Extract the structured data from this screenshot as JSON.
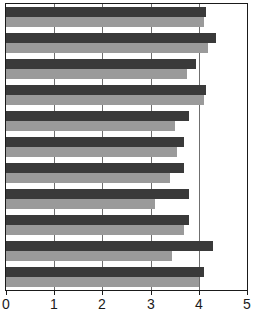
{
  "chart_data": {
    "type": "bar",
    "orientation": "horizontal",
    "title": "",
    "subtitle": "",
    "xlabel": "",
    "ylabel": "",
    "xlim": [
      0,
      5
    ],
    "ylim": null,
    "grid": true,
    "grid_axis": "x",
    "legend": false,
    "legend_position": "none",
    "xticks": [
      0,
      1,
      2,
      3,
      4,
      5
    ],
    "xticklabels": [
      "0",
      "1",
      "2",
      "3",
      "4",
      "5"
    ],
    "yticklabels": [],
    "categories": [
      "1",
      "2",
      "3",
      "4",
      "5",
      "6",
      "7",
      "8",
      "9",
      "10",
      "11"
    ],
    "series": [
      {
        "name": "series-1",
        "color": "#3a3a3a",
        "values": [
          4.15,
          4.35,
          3.95,
          4.15,
          3.8,
          3.7,
          3.7,
          3.8,
          3.8,
          4.3,
          4.1
        ]
      },
      {
        "name": "series-2",
        "color": "#9a9a9a",
        "values": [
          4.1,
          4.2,
          3.75,
          4.1,
          3.5,
          3.55,
          3.4,
          3.1,
          3.7,
          3.45,
          4.0
        ]
      }
    ],
    "extra_rows": {
      "note": "11 category groups, two bars each (dark above light)"
    }
  },
  "axis": {
    "x_tick_labels": [
      "0",
      "1",
      "2",
      "3",
      "4",
      "5"
    ]
  },
  "colors": {
    "series_dark": "#3a3a3a",
    "series_light": "#9a9a9a",
    "gridline": "#6f6f6f",
    "border": "#1a1a1a",
    "background": "#ffffff"
  }
}
